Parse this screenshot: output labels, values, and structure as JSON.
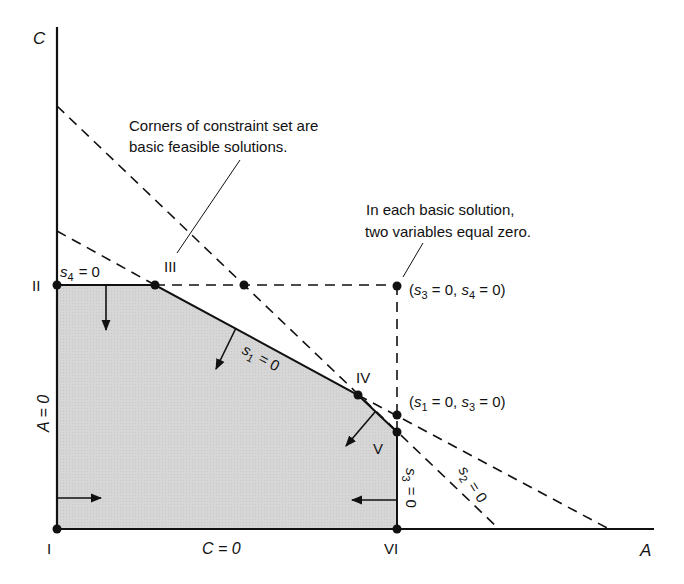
{
  "diagram": {
    "type": "linear-programming-constraint-set",
    "axes": {
      "x_label": "A",
      "y_label": "C",
      "x_axis_eq": "C = 0",
      "y_axis_eq": "A = 0"
    },
    "annotations": {
      "corners_note_line1": "Corners of constraint set are",
      "corners_note_line2": "basic feasible solutions.",
      "basic_note_line1": "In each basic solution,",
      "basic_note_line2": "two variables equal zero."
    },
    "vertices": [
      {
        "id": "I",
        "label": "I"
      },
      {
        "id": "II",
        "label": "II"
      },
      {
        "id": "III",
        "label": "III"
      },
      {
        "id": "IV",
        "label": "IV"
      },
      {
        "id": "V",
        "label": "V"
      },
      {
        "id": "VI",
        "label": "VI"
      }
    ],
    "infeasible_points": [
      {
        "label": "(s3 = 0, s4 = 0)",
        "var1": "s",
        "sub1": "3",
        "var2": "s",
        "sub2": "4"
      },
      {
        "label": "(s1 = 0, s3 = 0)",
        "var1": "s",
        "sub1": "1",
        "var2": "s",
        "sub2": "3"
      }
    ],
    "constraints": [
      {
        "name": "s1",
        "var": "s",
        "sub": "1",
        "eq": "= 0"
      },
      {
        "name": "s2",
        "var": "s",
        "sub": "2",
        "eq": "= 0"
      },
      {
        "name": "s3",
        "var": "s",
        "sub": "3",
        "eq": "= 0"
      },
      {
        "name": "s4",
        "var": "s",
        "sub": "4",
        "eq": "= 0"
      }
    ],
    "colors": {
      "feasible_fill": "#d9d9d9",
      "line": "#111111",
      "background": "#ffffff"
    }
  }
}
